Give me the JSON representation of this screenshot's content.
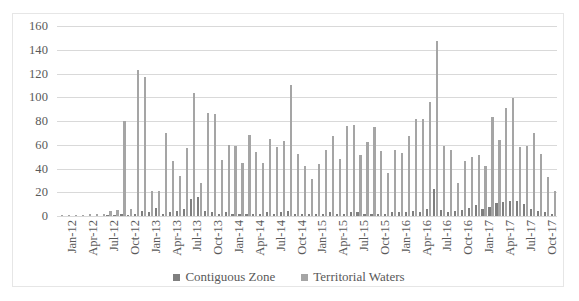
{
  "chart_data": {
    "type": "bar",
    "title": "",
    "xlabel": "",
    "ylabel": "",
    "ylim": [
      0,
      160
    ],
    "yticks": [
      0,
      20,
      40,
      60,
      80,
      100,
      120,
      140,
      160
    ],
    "grid": true,
    "legend_position": "bottom",
    "legend": [
      "Contiguous Zone",
      "Territorial Waters"
    ],
    "colors": {
      "contiguous_zone": "#7f7f7f",
      "territorial_waters": "#a5a5a5",
      "gridline": "#d9d9d9",
      "axis_text": "#595959",
      "border": "#e6e6e6"
    },
    "tick_labels": [
      "Jan-12",
      "Apr-12",
      "Jul-12",
      "Oct-12",
      "Jan-13",
      "Apr-13",
      "Jul-13",
      "Oct-13",
      "Jan-14",
      "Apr-14",
      "Jul-14",
      "Oct-14",
      "Jan-15",
      "Apr-15",
      "Jul-15",
      "Oct-15",
      "Jan-16",
      "Apr-16",
      "Jul-16",
      "Oct-16",
      "Jan-17",
      "Apr-17",
      "Jul-17",
      "Oct-17"
    ],
    "categories": [
      "Jan-12",
      "Feb-12",
      "Mar-12",
      "Apr-12",
      "May-12",
      "Jun-12",
      "Jul-12",
      "Aug-12",
      "Sep-12",
      "Oct-12",
      "Nov-12",
      "Dec-12",
      "Jan-13",
      "Feb-13",
      "Mar-13",
      "Apr-13",
      "May-13",
      "Jun-13",
      "Jul-13",
      "Aug-13",
      "Sep-13",
      "Oct-13",
      "Nov-13",
      "Dec-13",
      "Jan-14",
      "Feb-14",
      "Mar-14",
      "Apr-14",
      "May-14",
      "Jun-14",
      "Jul-14",
      "Aug-14",
      "Sep-14",
      "Oct-14",
      "Nov-14",
      "Dec-14",
      "Jan-15",
      "Feb-15",
      "Mar-15",
      "Apr-15",
      "May-15",
      "Jun-15",
      "Jul-15",
      "Aug-15",
      "Sep-15",
      "Oct-15",
      "Nov-15",
      "Dec-15",
      "Jan-16",
      "Feb-16",
      "Mar-16",
      "Apr-16",
      "May-16",
      "Jun-16",
      "Jul-16",
      "Aug-16",
      "Sep-16",
      "Oct-16",
      "Nov-16",
      "Dec-16",
      "Jan-17",
      "Feb-17",
      "Mar-17",
      "Apr-17",
      "May-17",
      "Jun-17",
      "Jul-17",
      "Aug-17",
      "Sep-17",
      "Oct-17",
      "Nov-17",
      "Dec-17"
    ],
    "series": [
      {
        "name": "Contiguous Zone",
        "values": [
          0,
          0,
          0,
          0,
          0,
          0,
          0,
          1,
          1,
          2,
          1,
          2,
          4,
          3,
          7,
          2,
          3,
          4,
          6,
          14,
          16,
          4,
          3,
          2,
          3,
          2,
          2,
          2,
          2,
          2,
          3,
          2,
          3,
          4,
          2,
          2,
          2,
          2,
          2,
          3,
          2,
          2,
          3,
          3,
          2,
          2,
          2,
          2,
          3,
          3,
          3,
          4,
          3,
          6,
          23,
          5,
          3,
          4,
          5,
          7,
          9,
          6,
          8,
          11,
          12,
          13,
          13,
          10,
          6,
          4,
          3,
          2
        ]
      },
      {
        "name": "Territorial Waters",
        "values": [
          1,
          1,
          1,
          1,
          2,
          2,
          2,
          4,
          5,
          80,
          6,
          123,
          117,
          21,
          21,
          70,
          46,
          34,
          57,
          104,
          28,
          87,
          86,
          47,
          60,
          59,
          45,
          68,
          54,
          45,
          65,
          58,
          63,
          110,
          52,
          42,
          31,
          44,
          56,
          67,
          48,
          76,
          77,
          51,
          62,
          75,
          55,
          36,
          56,
          53,
          67,
          82,
          82,
          96,
          147,
          59,
          56,
          28,
          46,
          50,
          51,
          42,
          83,
          64,
          91,
          99,
          58,
          59,
          70,
          52,
          33,
          21
        ]
      }
    ]
  }
}
